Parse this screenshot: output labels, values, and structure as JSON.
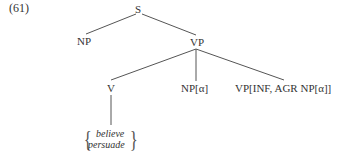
{
  "example_number": "(61)",
  "tree": {
    "root": {
      "label": "S"
    },
    "subject": {
      "label": "NP"
    },
    "vp": {
      "label": "VP"
    },
    "verb": {
      "label": "V"
    },
    "object": {
      "label": "NP[α]"
    },
    "complement": {
      "label": "VP[INF, AGR NP[α]]"
    },
    "lexical_alternatives": [
      "believe",
      "persuade"
    ]
  }
}
